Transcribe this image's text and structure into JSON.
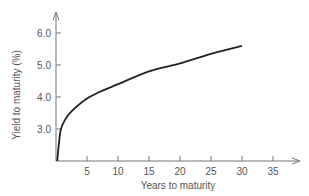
{
  "chart_data": {
    "type": "line",
    "title": "",
    "xlabel": "Years to maturity",
    "ylabel": "Yield to maturity (%)",
    "xlim": [
      0,
      38
    ],
    "ylim": [
      2.0,
      6.5
    ],
    "x_ticks": [
      5,
      10,
      15,
      20,
      25,
      30,
      35
    ],
    "x_tick_labels": [
      "5",
      "10",
      "15",
      "20",
      "25",
      "30",
      "35"
    ],
    "y_ticks": [
      3.0,
      4.0,
      5.0,
      6.0
    ],
    "y_tick_labels": [
      "3.0",
      "4.0",
      "5.0",
      "6.0"
    ],
    "grid": false,
    "legend": null,
    "series": [
      {
        "name": "Yield curve",
        "x": [
          0.2,
          0.5,
          0.8,
          1.5,
          2.5,
          5,
          7.5,
          10,
          15,
          20,
          25,
          30
        ],
        "values": [
          2.0,
          2.6,
          3.0,
          3.3,
          3.55,
          3.95,
          4.2,
          4.4,
          4.8,
          5.05,
          5.35,
          5.6
        ]
      }
    ],
    "color": "#222222",
    "axis_color": "#777777"
  }
}
